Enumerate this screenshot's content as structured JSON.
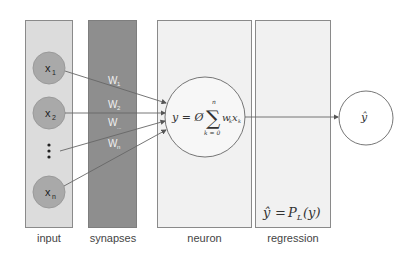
{
  "diagram": {
    "type": "single-layer neural network with regression output",
    "columns": [
      {
        "id": "input",
        "label": "input"
      },
      {
        "id": "synapses",
        "label": "synapses"
      },
      {
        "id": "neuron",
        "label": "neuron"
      },
      {
        "id": "regression",
        "label": "regression"
      }
    ],
    "inputs": [
      {
        "var": "x",
        "sub": "1"
      },
      {
        "var": "x",
        "sub": "2"
      },
      {
        "var": "x",
        "sub": "n"
      }
    ],
    "ellipsis": "⋮",
    "weights": [
      {
        "var": "W",
        "sub": "1"
      },
      {
        "var": "W",
        "sub": "2"
      },
      {
        "var": "W",
        "sub": "..."
      },
      {
        "var": "W",
        "sub": "n"
      }
    ],
    "neuron_formula": {
      "lhs": "y = Ø",
      "sum_symbol": "∑",
      "sum_upper": "n",
      "sum_lower": "k = 0",
      "term": "w",
      "term_sub": "k",
      "term2": "x",
      "term2_sub": "k"
    },
    "regression_formula": {
      "lhs": "ŷ",
      "eq": "=",
      "rhs": "P",
      "rhs_sub": "L",
      "arg": "(y)"
    },
    "output": {
      "label": "ŷ"
    },
    "colors": {
      "input_panel": "#dcdcdc",
      "synapse_panel": "#8e8e8e",
      "neuron_panel": "#f1f1f1",
      "regression_panel": "#f1f1f1",
      "node_fill": "#a9a9a9",
      "line": "#666666"
    }
  }
}
